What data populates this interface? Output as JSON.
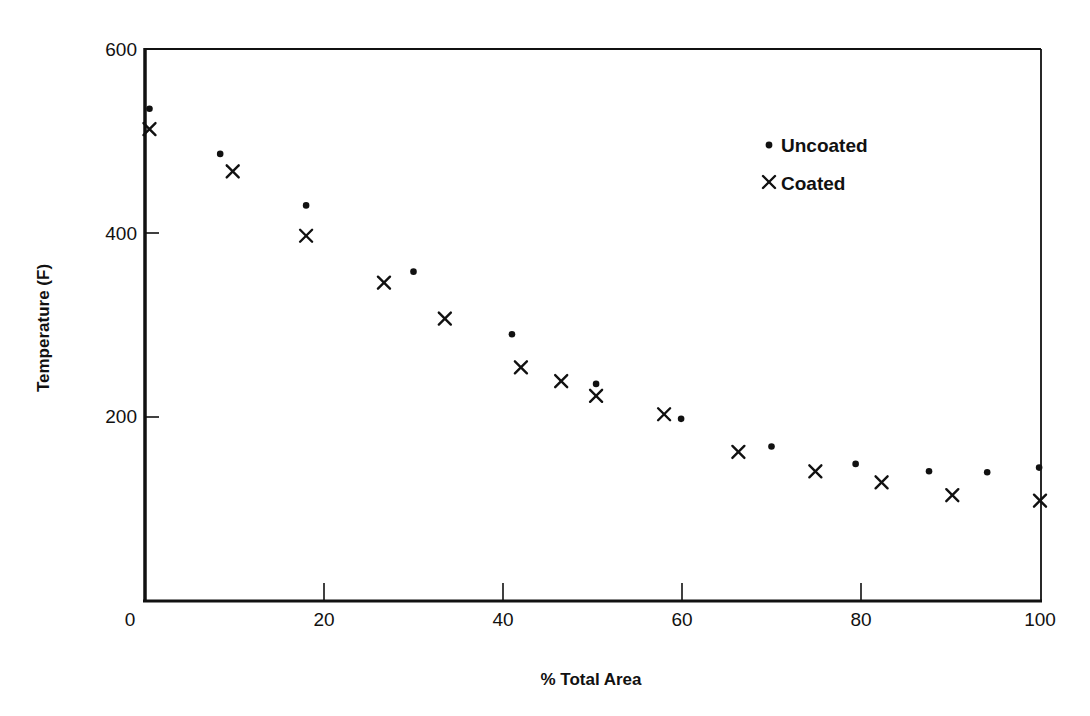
{
  "chart_data": {
    "type": "scatter",
    "title": "",
    "xlabel": "% Total Area",
    "ylabel": "Temperature (F)",
    "xlim": [
      0,
      100
    ],
    "ylim": [
      0,
      600
    ],
    "xticks": [
      0,
      20,
      40,
      60,
      80,
      100
    ],
    "yticks": [
      200,
      400,
      600
    ],
    "xtick_labels": [
      "0",
      "20",
      "40",
      "60",
      "80",
      "100"
    ],
    "ytick_labels": [
      "200",
      "400",
      "600"
    ],
    "grid": false,
    "legend_position": "upper right (inside plot)",
    "series": [
      {
        "name": "Uncoated",
        "marker": "dot",
        "x": [
          0.5,
          8.4,
          18,
          30,
          41,
          50.4,
          59.9,
          70,
          79.4,
          87.6,
          94.1,
          99.9
        ],
        "y": [
          535,
          486,
          430,
          358,
          290,
          236,
          198,
          168,
          149,
          141,
          140,
          145
        ]
      },
      {
        "name": "Coated",
        "marker": "x",
        "x": [
          0.5,
          9.8,
          18,
          26.7,
          33.5,
          42,
          46.5,
          50.4,
          58,
          66.3,
          74.9,
          82.3,
          90.2,
          100
        ],
        "y": [
          513,
          467,
          397,
          346,
          307,
          254,
          239,
          223,
          203,
          162,
          141,
          129,
          115,
          109
        ]
      }
    ]
  },
  "axes": {
    "x_title": "% Total Area",
    "y_title": "Temperature (F)",
    "x_tick_labels": [
      "0",
      "20",
      "40",
      "60",
      "80",
      "100"
    ],
    "y_tick_labels": [
      "200",
      "400",
      "600"
    ]
  },
  "legend": {
    "items": [
      {
        "label": "Uncoated",
        "marker": "dot"
      },
      {
        "label": "Coated",
        "marker": "x"
      }
    ]
  },
  "colors": {
    "ink": "#111111",
    "background": "#ffffff"
  }
}
